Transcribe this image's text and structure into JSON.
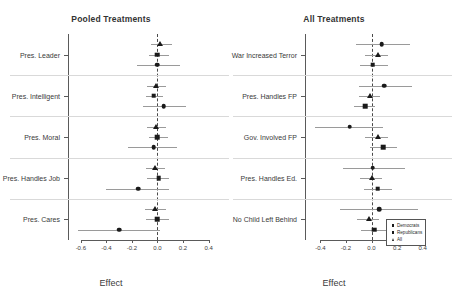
{
  "chart_data": [
    {
      "type": "scatter",
      "panel": "left",
      "title": "Pooled Treatments",
      "xlabel": "Effect",
      "ylabel": "",
      "xlim": [
        -0.7,
        0.45
      ],
      "xticks": [
        -0.6,
        -0.4,
        -0.2,
        0.0,
        0.2,
        0.4
      ],
      "xticklabels": [
        "-0.6",
        "-0.4",
        "-0.2",
        "0.0",
        "0.2",
        "0.4"
      ],
      "grid": false,
      "zero_reference_line": 0.0,
      "legend": "none",
      "categories": [
        "Pres. Leader",
        "Pres. Intelligent",
        "Pres. Moral",
        "Pres. Handles Job",
        "Pres. Cares"
      ],
      "series": [
        {
          "name": "All",
          "marker": "triangle",
          "estimates": [
            0.02,
            -0.01,
            -0.01,
            -0.02,
            -0.02
          ],
          "ci_low": [
            -0.05,
            -0.08,
            -0.08,
            -0.09,
            -0.1
          ],
          "ci_high": [
            0.11,
            0.07,
            0.07,
            0.06,
            0.07
          ]
        },
        {
          "name": "Republicans",
          "marker": "square",
          "estimates": [
            0.0,
            -0.03,
            0.0,
            0.01,
            0.0
          ],
          "ci_low": [
            -0.07,
            -0.09,
            -0.07,
            -0.08,
            -0.09
          ],
          "ci_high": [
            0.09,
            0.04,
            0.08,
            0.09,
            0.09
          ]
        },
        {
          "name": "Democrats",
          "marker": "circle",
          "estimates": [
            0.0,
            0.05,
            -0.03,
            -0.15,
            -0.3
          ],
          "ci_low": [
            -0.16,
            -0.11,
            -0.23,
            -0.4,
            -0.62
          ],
          "ci_high": [
            0.18,
            0.22,
            0.15,
            0.09,
            0.02
          ]
        }
      ]
    },
    {
      "type": "scatter",
      "panel": "right",
      "title": "All Treatments",
      "xlabel": "Effect",
      "ylabel": "",
      "xlim": [
        -0.52,
        0.52
      ],
      "xticks": [
        -0.4,
        -0.2,
        0.0,
        0.2,
        0.4
      ],
      "xticklabels": [
        "-0.4",
        "-0.2",
        "0.0",
        "0.2",
        "0.4"
      ],
      "grid": false,
      "zero_reference_line": 0.0,
      "legend": "bottom-right",
      "categories": [
        "War Increased Terror",
        "Pres. Handles FP",
        "Gov. Involved FP",
        "Pres. Handles Ed.",
        "No Child Left Behind"
      ],
      "series": [
        {
          "name": "Democrats",
          "marker": "circle",
          "estimates": [
            0.08,
            0.1,
            -0.17,
            0.01,
            0.06
          ],
          "ci_low": [
            -0.12,
            -0.1,
            -0.44,
            -0.22,
            -0.25
          ],
          "ci_high": [
            0.3,
            0.32,
            0.09,
            0.26,
            0.36
          ]
        },
        {
          "name": "All",
          "marker": "triangle",
          "estimates": [
            0.05,
            -0.01,
            0.05,
            0.0,
            -0.02
          ],
          "ci_low": [
            -0.05,
            -0.1,
            -0.05,
            -0.09,
            -0.11
          ]
        },
        {
          "name": "Republicans",
          "marker": "square",
          "estimates": [
            0.01,
            -0.05,
            0.09,
            0.05,
            0.02
          ],
          "ci_low": [
            -0.09,
            -0.14,
            -0.01,
            -0.06,
            -0.08
          ],
          "ci_high": [
            0.13,
            0.03,
            0.2,
            0.16,
            0.13
          ]
        }
      ],
      "legend_entries": [
        {
          "label": "Democrats",
          "marker": "square"
        },
        {
          "label": "Republicans",
          "marker": "square"
        },
        {
          "label": "All",
          "marker": "triangle"
        }
      ]
    }
  ]
}
